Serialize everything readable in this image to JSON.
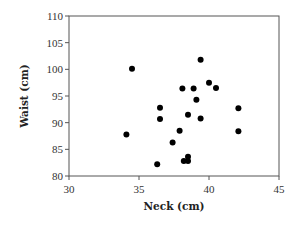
{
  "chart_data": {
    "type": "scatter",
    "title": "",
    "xlabel": "Neck (cm)",
    "ylabel": "Waist (cm)",
    "xlim": [
      30,
      45
    ],
    "ylim": [
      80,
      110
    ],
    "xticks": [
      30,
      35,
      40,
      45
    ],
    "yticks": [
      80,
      85,
      90,
      95,
      100,
      105,
      110
    ],
    "grid": false,
    "legend": null,
    "marker_color": "#000000",
    "points": [
      {
        "x": 34.5,
        "y": 100.1
      },
      {
        "x": 34.1,
        "y": 87.8
      },
      {
        "x": 39.4,
        "y": 101.8
      },
      {
        "x": 40.0,
        "y": 97.5
      },
      {
        "x": 40.5,
        "y": 96.5
      },
      {
        "x": 38.1,
        "y": 96.4
      },
      {
        "x": 38.9,
        "y": 96.4
      },
      {
        "x": 39.1,
        "y": 94.3
      },
      {
        "x": 36.5,
        "y": 92.8
      },
      {
        "x": 36.5,
        "y": 90.7
      },
      {
        "x": 38.5,
        "y": 91.5
      },
      {
        "x": 39.4,
        "y": 90.8
      },
      {
        "x": 37.9,
        "y": 88.5
      },
      {
        "x": 37.4,
        "y": 86.3
      },
      {
        "x": 38.5,
        "y": 83.6
      },
      {
        "x": 38.2,
        "y": 82.8
      },
      {
        "x": 38.5,
        "y": 82.8
      },
      {
        "x": 36.3,
        "y": 82.2
      },
      {
        "x": 42.1,
        "y": 92.7
      },
      {
        "x": 42.1,
        "y": 88.4
      }
    ]
  }
}
